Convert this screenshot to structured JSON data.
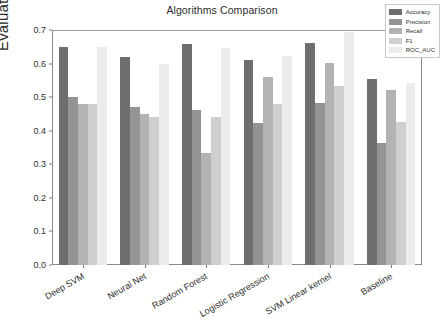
{
  "chart_data": {
    "type": "bar",
    "title": "Algorithms Comparison",
    "xlabel": "",
    "ylabel": "Evaluation Metrics",
    "ylim": [
      0.0,
      0.7
    ],
    "yticks": [
      "0.0",
      "0.1",
      "0.2",
      "0.3",
      "0.4",
      "0.5",
      "0.6",
      "0.7"
    ],
    "ytick_values": [
      0.0,
      0.1,
      0.2,
      0.3,
      0.4,
      0.5,
      0.6,
      0.7
    ],
    "grid": false,
    "legend_position": "upper right",
    "categories": [
      "Deep SVM",
      "Neural Net",
      "Random Forest",
      "Logistic Regression",
      "SVM Linear kernel",
      "Baseline"
    ],
    "series": [
      {
        "name": "Accuracy",
        "color": "#6e6e6e",
        "values": [
          0.648,
          0.621,
          0.659,
          0.611,
          0.662,
          0.555
        ]
      },
      {
        "name": "Precision",
        "color": "#949494",
        "values": [
          0.5,
          0.47,
          0.461,
          0.422,
          0.483,
          0.363
        ]
      },
      {
        "name": "Recall",
        "color": "#b3b3b3",
        "values": [
          0.481,
          0.45,
          0.335,
          0.561,
          0.603,
          0.522
        ]
      },
      {
        "name": "F1",
        "color": "#cfcfcf",
        "values": [
          0.48,
          0.44,
          0.44,
          0.48,
          0.533,
          0.425
        ]
      },
      {
        "name": "ROC_AUC",
        "color": "#ececec",
        "values": [
          0.648,
          0.6,
          0.645,
          0.622,
          0.695,
          0.543
        ]
      }
    ]
  }
}
